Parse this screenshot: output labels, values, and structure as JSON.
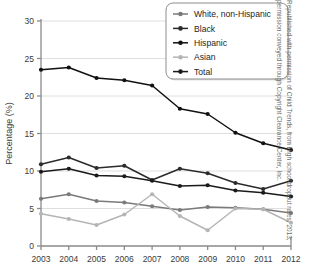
{
  "chart_data": {
    "type": "line",
    "title": "",
    "xlabel": "",
    "ylabel": "Percentage (%)",
    "categories": [
      "2003",
      "2004",
      "2005",
      "2006",
      "2007",
      "2008",
      "2009",
      "2010",
      "2011",
      "2012"
    ],
    "x": [
      2003,
      2004,
      2005,
      2006,
      2007,
      2008,
      2009,
      2010,
      2011,
      2012
    ],
    "ylim": [
      0,
      30
    ],
    "yticks": [
      0,
      5,
      10,
      15,
      20,
      25,
      30
    ],
    "ytick_labels": [
      "0",
      "5",
      "10",
      "15",
      "20",
      "25",
      "30"
    ],
    "grid": "horizontal",
    "legend_position": "top-right",
    "series": [
      {
        "name": "White, non-Hispanic",
        "color": "#7a7a7a",
        "marker": "circle",
        "values": [
          6.3,
          6.9,
          6.0,
          5.8,
          5.3,
          4.8,
          5.2,
          5.1,
          4.9,
          4.4
        ]
      },
      {
        "name": "Black",
        "color": "#2b2b2b",
        "marker": "circle",
        "values": [
          10.9,
          11.8,
          10.4,
          10.7,
          8.8,
          10.3,
          9.7,
          8.4,
          7.6,
          8.7
        ]
      },
      {
        "name": "Hispanic",
        "color": "#111111",
        "marker": "circle",
        "values": [
          23.5,
          23.8,
          22.4,
          22.1,
          21.4,
          18.3,
          17.6,
          15.1,
          13.7,
          12.8
        ]
      },
      {
        "name": "Asian",
        "color": "#b5b5b5",
        "marker": "circle",
        "values": [
          4.3,
          3.6,
          2.8,
          4.2,
          6.9,
          4.0,
          2.1,
          5.0,
          4.9,
          3.1
        ]
      },
      {
        "name": "Total",
        "color": "#1a1a1a",
        "marker": "circle",
        "values": [
          9.9,
          10.3,
          9.4,
          9.3,
          8.7,
          8.0,
          8.1,
          7.4,
          7.1,
          6.6
        ]
      }
    ]
  },
  "credit": {
    "text": "Republished with permission of Child Trends, from High school dropout rates, 2013; permission conveyed through Copyright Clearance Center, Inc."
  }
}
